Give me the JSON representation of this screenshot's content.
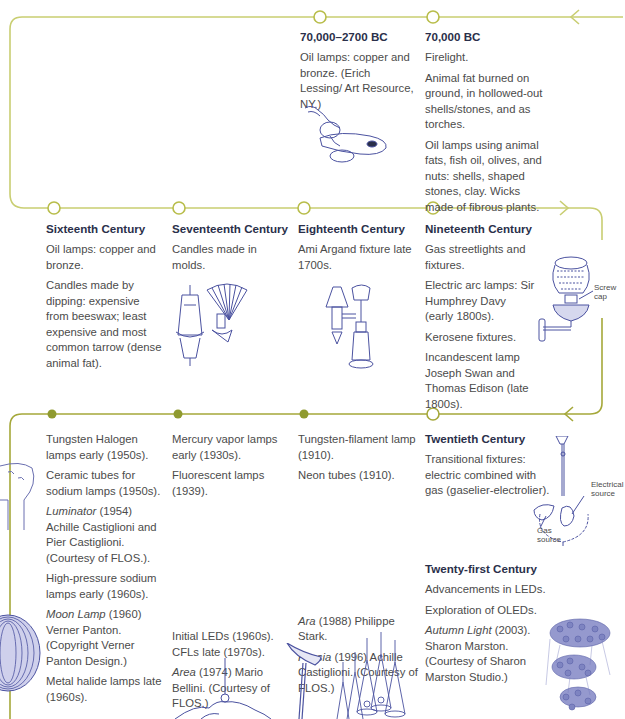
{
  "colors": {
    "timeline_light": "#c9ce72",
    "timeline_dark": "#9b9e32",
    "dot_fill": "#8f9a2f",
    "heading": "#2a2f4a",
    "body_text": "#4b4b4b",
    "illustration": "#4b52a0"
  },
  "rows": [
    {
      "row": 1,
      "entries": [
        {
          "id": "bc-70000-2700",
          "title": "70,000–2700 BC",
          "paragraphs": [
            "Oil lamps: copper and bronze. (Erich Lessing/ Art Resource, NY.)"
          ],
          "illustration": "oil-lamp-icon"
        },
        {
          "id": "bc-70000",
          "title": "70,000 BC",
          "paragraphs": [
            "Firelight.",
            "Animal fat burned on ground, in hollowed-out shells/stones, and as torches.",
            "Oil lamps using animal fats, fish oil, olives, and nuts: shells, shaped stones, clay. Wicks made of fibrous plants."
          ]
        }
      ]
    },
    {
      "row": 2,
      "entries": [
        {
          "id": "sixteenth",
          "title": "Sixteenth Century",
          "paragraphs": [
            "Oil lamps: copper and bronze.",
            "Candles made by dipping: expensive from beeswax; least expensive and most common tarrow (dense animal fat)."
          ]
        },
        {
          "id": "seventeenth",
          "title": "Seventeenth Century",
          "paragraphs": [
            "Candles made in molds."
          ],
          "illustration": "chandelier-and-sconce-icon"
        },
        {
          "id": "eighteenth",
          "title": "Eighteenth Century",
          "paragraphs": [
            "Ami Argand fixture late 1700s."
          ],
          "illustration": "argand-lamp-icon"
        },
        {
          "id": "nineteenth",
          "title": "Nineteenth Century",
          "paragraphs": [
            "Gas streetlights and fixtures.",
            "Electric arc lamps: Sir Humphrey Davy (early 1800s).",
            "Kerosene fixtures.",
            "Incandescent lamp Joseph Swan and Thomas Edison (late 1800s)."
          ],
          "illustration": "kerosene-wall-lamp-icon",
          "callout": "Screw cap"
        }
      ]
    },
    {
      "row": 3,
      "entries": [
        {
          "id": "twentieth-a",
          "paragraphs": [
            "Tungsten Halogen lamps early (1950s).",
            "Ceramic tubes for sodium lamps (1950s).",
            "Luminator (1954) Achille Castiglioni and Pier Castiglioni. (Courtesy of FLOS.).",
            "High-pressure sodium lamps early (1960s).",
            "Moon Lamp (1960) Verner Panton. (Copyright Verner Panton Design.)",
            "Metal halide lamps late (1960s)."
          ],
          "italic_terms": [
            "Luminator",
            "Moon Lamp"
          ],
          "illustrations": [
            "luminator-lamp-icon",
            "moon-lamp-icon"
          ]
        },
        {
          "id": "twentieth-b",
          "paragraphs": [
            "Mercury vapor lamps early (1930s).",
            "Fluorescent lamps (1939).",
            "Initial LEDs (1960s). CFLs late (1970s).",
            "Area (1974) Mario Bellini. (Courtesy of FLOS.)"
          ],
          "italic_terms": [
            "Area"
          ],
          "illustration": "area-pendant-icon"
        },
        {
          "id": "twentieth-c",
          "paragraphs": [
            "Tungsten-filament lamp (1910).",
            "Neon tubes (1910).",
            "Ara (1988) Philippe Stark.",
            "Fucsia (1996) Achille Castiglioni. (Courtesy of FLOS.)"
          ],
          "italic_terms": [
            "Ara",
            "Fucsia"
          ],
          "illustrations": [
            "ara-lamp-icon",
            "fucsia-pendant-icon"
          ]
        },
        {
          "id": "twentieth",
          "title": "Twentieth Century",
          "paragraphs": [
            "Transitional fixtures: electric combined with gas (gaselier-electrolier)."
          ],
          "illustration": "gaselier-icon",
          "callouts": [
            "Electrical source",
            "Gas source"
          ]
        },
        {
          "id": "twenty-first",
          "title": "Twenty-first Century",
          "paragraphs": [
            "Advancements in LEDs.",
            "Exploration of OLEDs.",
            "Autumn Light (2003). Sharon Marston. (Courtesy of Sharon Marston Studio.)"
          ],
          "italic_terms": [
            "Autumn Light"
          ],
          "illustration": "autumn-light-icon"
        }
      ]
    }
  ],
  "text": {
    "e1_title": "70,000–2700 BC",
    "e1_p1": "Oil lamps: copper and bronze. (Erich Lessing/ Art Resource, NY.)",
    "e2_title": "70,000 BC",
    "e2_p1": "Firelight.",
    "e2_p2": "Animal fat burned on ground, in hollowed-out shells/stones, and as torches.",
    "e2_p3": "Oil lamps using animal fats, fish oil, olives, and nuts: shells, shaped stones, clay. Wicks made of fibrous plants.",
    "e3_title": "Sixteenth Century",
    "e3_p1": "Oil lamps: copper and bronze.",
    "e3_p2": "Candles made by dipping: expensive from beeswax; least expensive and most common tarrow (dense animal fat).",
    "e4_title": "Seventeenth Century",
    "e4_p1": "Candles made in molds.",
    "e5_title": "Eighteenth Century",
    "e5_p1": "Ami Argand fixture late 1700s.",
    "e6_title": "Nineteenth Century",
    "e6_p1": "Gas streetlights and fixtures.",
    "e6_p2": "Electric arc lamps: Sir Humphrey Davy (early 1800s).",
    "e6_p3": "Kerosene fixtures.",
    "e6_p4": "Incandescent lamp Joseph Swan and Thomas Edison (late 1800s).",
    "e6_callout": "Screw cap",
    "e7_p1": "Tungsten Halogen lamps early (1950s).",
    "e7_p2": "Ceramic tubes for sodium lamps (1950s).",
    "e7_p3_italic": "Luminator",
    "e7_p3_rest": " (1954) Achille Castiglioni and Pier Castiglioni. (Courtesy of FLOS.).",
    "e7_p4": "High-pressure sodium lamps early (1960s).",
    "e7_p5_italic": "Moon Lamp",
    "e7_p5_rest": " (1960) Verner Panton. (Copyright Verner Panton Design.)",
    "e7_p6": "Metal halide lamps late (1960s).",
    "e8_p1": "Mercury vapor lamps early (1930s).",
    "e8_p2": "Fluorescent lamps (1939).",
    "e8_p3": "Initial LEDs (1960s). CFLs late (1970s).",
    "e8_p4_italic": "Area",
    "e8_p4_rest": " (1974) Mario Bellini. (Courtesy of FLOS.)",
    "e9_p1": "Tungsten-filament lamp (1910).",
    "e9_p2": "Neon tubes (1910).",
    "e9_p3_italic": "Ara",
    "e9_p3_rest": " (1988) Philippe Stark.",
    "e9_p4_italic": "Fucsia",
    "e9_p4_rest": " (1996) Achille Castiglioni. (Courtesy of FLOS.)",
    "e10_title": "Twentieth Century",
    "e10_p1": "Transitional fixtures: electric combined with gas (gaselier-electrolier).",
    "e10_callout_electric": "Electrical source",
    "e10_callout_gas": "Gas source",
    "e11_title": "Twenty-first Century",
    "e11_p1": "Advancements in LEDs.",
    "e11_p2": "Exploration of OLEDs.",
    "e11_p3_italic": "Autumn Light",
    "e11_p3_rest": " (2003). Sharon Marston. (Courtesy of Sharon Marston Studio.)"
  }
}
